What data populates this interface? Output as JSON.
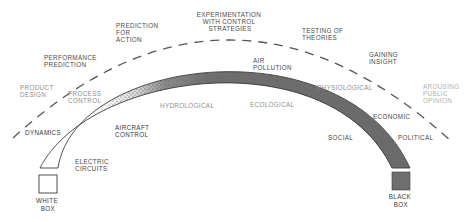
{
  "diagram": {
    "endpoints": {
      "left": {
        "label_line1": "WHITE",
        "label_line2": "BOX",
        "fill": "#ffffff"
      },
      "right": {
        "label_line1": "BLACK",
        "label_line2": "BOX",
        "fill": "#6e6e6e"
      }
    },
    "purposes_dashed_arc": [
      {
        "id": "product-design",
        "lines": [
          "PRODUCT",
          "DESIGN"
        ]
      },
      {
        "id": "performance-prediction",
        "lines": [
          "PERFORMANCE",
          "PREDICTION"
        ]
      },
      {
        "id": "prediction-for-action",
        "lines": [
          "PREDICTION",
          "FOR",
          "ACTION"
        ]
      },
      {
        "id": "experimentation",
        "lines": [
          "EXPERIMENTATION",
          "WITH CONTROL",
          "STRATEGIES"
        ]
      },
      {
        "id": "testing-of-theories",
        "lines": [
          "TESTING OF",
          "THEORIES"
        ]
      },
      {
        "id": "gaining-insight",
        "lines": [
          "GAINING",
          "INSIGHT"
        ]
      },
      {
        "id": "arousing-public-opinion",
        "lines": [
          "AROUSING",
          "PUBLIC",
          "OPINION"
        ]
      }
    ],
    "domains_solid_arc": [
      {
        "id": "dynamics",
        "lines": [
          "DYNAMICS"
        ]
      },
      {
        "id": "electric-circuits",
        "lines": [
          "ELECTRIC",
          "CIRCUITS"
        ]
      },
      {
        "id": "process-control",
        "lines": [
          "PROCESS",
          "CONTROL"
        ]
      },
      {
        "id": "aircraft-control",
        "lines": [
          "AIRCRAFT",
          "CONTROL"
        ]
      },
      {
        "id": "hydrological",
        "lines": [
          "HYDROLOGICAL"
        ]
      },
      {
        "id": "air-pollution",
        "lines": [
          "AIR",
          "POLLUTION"
        ]
      },
      {
        "id": "ecological",
        "lines": [
          "ECOLOGICAL"
        ]
      },
      {
        "id": "physiological",
        "lines": [
          "PHYSIOLOGICAL"
        ]
      },
      {
        "id": "economic",
        "lines": [
          "ECONOMIC"
        ]
      },
      {
        "id": "social",
        "lines": [
          "SOCIAL"
        ]
      },
      {
        "id": "political",
        "lines": [
          "POLITICAL"
        ]
      }
    ],
    "colors": {
      "arc_dark": "#6a6a6a",
      "arc_outline": "#3c3c3c",
      "dash": "#555555",
      "text": "#4a4a4a"
    }
  }
}
